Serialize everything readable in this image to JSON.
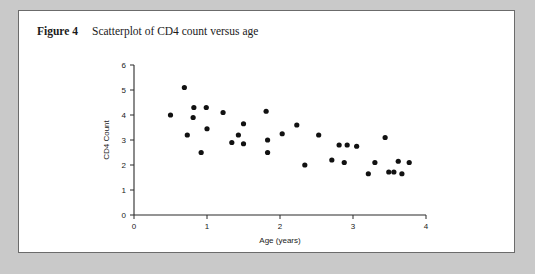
{
  "caption": {
    "label": "Figure 4",
    "text": "Scatterplot of CD4 count versus age"
  },
  "chart_data": {
    "type": "scatter",
    "title": "Scatterplot of CD4 count versus age",
    "xlabel": "Age (years)",
    "ylabel": "CD4 Count",
    "xlim": [
      0,
      4
    ],
    "ylim": [
      0,
      6
    ],
    "xticks": [
      0,
      1,
      2,
      3,
      4
    ],
    "yticks": [
      0,
      1,
      2,
      3,
      4,
      5,
      6
    ],
    "xtick_labels": [
      "0",
      "1",
      "2",
      "3",
      "4"
    ],
    "ytick_labels": [
      "0",
      "1",
      "2",
      "3",
      "4",
      "5",
      "6"
    ],
    "grid": false,
    "legend": null,
    "marker": "filled-circle",
    "marker_color": "#111111",
    "points": [
      {
        "x": 0.5,
        "y": 4.0
      },
      {
        "x": 0.69,
        "y": 5.1
      },
      {
        "x": 0.73,
        "y": 3.2
      },
      {
        "x": 0.81,
        "y": 3.9
      },
      {
        "x": 0.82,
        "y": 4.3
      },
      {
        "x": 0.92,
        "y": 2.5
      },
      {
        "x": 0.99,
        "y": 4.3
      },
      {
        "x": 1.0,
        "y": 3.45
      },
      {
        "x": 1.22,
        "y": 4.1
      },
      {
        "x": 1.34,
        "y": 2.9
      },
      {
        "x": 1.43,
        "y": 3.2
      },
      {
        "x": 1.5,
        "y": 3.65
      },
      {
        "x": 1.5,
        "y": 2.85
      },
      {
        "x": 1.81,
        "y": 4.15
      },
      {
        "x": 1.83,
        "y": 3.0
      },
      {
        "x": 1.83,
        "y": 2.5
      },
      {
        "x": 2.03,
        "y": 3.25
      },
      {
        "x": 2.23,
        "y": 3.6
      },
      {
        "x": 2.34,
        "y": 2.0
      },
      {
        "x": 2.53,
        "y": 3.2
      },
      {
        "x": 2.71,
        "y": 2.2
      },
      {
        "x": 2.81,
        "y": 2.8
      },
      {
        "x": 2.88,
        "y": 2.1
      },
      {
        "x": 2.92,
        "y": 2.8
      },
      {
        "x": 3.05,
        "y": 2.75
      },
      {
        "x": 3.21,
        "y": 1.65
      },
      {
        "x": 3.3,
        "y": 2.1
      },
      {
        "x": 3.44,
        "y": 3.1
      },
      {
        "x": 3.49,
        "y": 1.72
      },
      {
        "x": 3.56,
        "y": 1.72
      },
      {
        "x": 3.62,
        "y": 2.15
      },
      {
        "x": 3.67,
        "y": 1.65
      },
      {
        "x": 3.77,
        "y": 2.1
      }
    ]
  }
}
